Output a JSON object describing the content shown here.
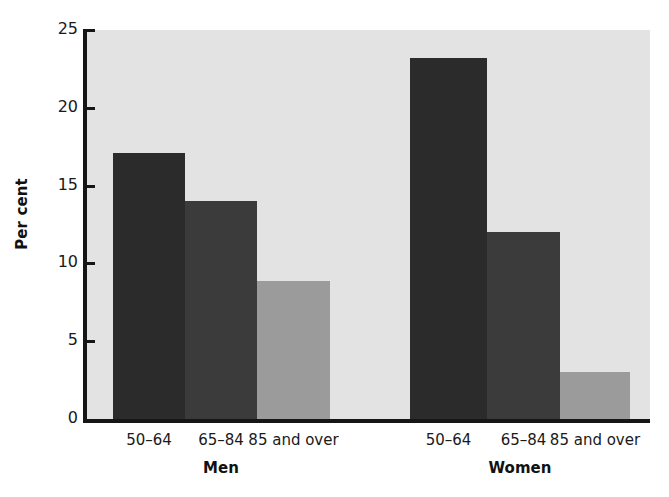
{
  "chart_data": {
    "type": "bar",
    "title": "",
    "subtitle": "",
    "xlabel": "",
    "ylabel": "Per cent",
    "ylim": [
      0,
      25
    ],
    "ytick_labels": [
      "0",
      "5",
      "10",
      "15",
      "20",
      "25"
    ],
    "ytick_values": [
      0,
      5,
      10,
      15,
      20,
      25
    ],
    "grid": false,
    "legend": "none",
    "categories": [
      "50–64",
      "65–84",
      "85 and over"
    ],
    "groups": [
      "Men",
      "Women"
    ],
    "series": [
      {
        "name": "Men",
        "values": [
          17.1,
          14.0,
          8.9
        ]
      },
      {
        "name": "Women",
        "values": [
          23.2,
          12.0,
          3.0
        ]
      }
    ],
    "bar_shades": [
      "dark",
      "medium",
      "light"
    ],
    "colors": {
      "bar_dark": "#2b2b2b",
      "bar_medium": "#3b3b3b",
      "bar_light": "#9b9b9b",
      "plot_background": "#e3e3e3",
      "axis": "#161616",
      "text": "#1a1a1a",
      "page_background": "#ffffff"
    }
  },
  "axis": {
    "y_title": "Per cent",
    "ticks": [
      {
        "label": "25",
        "value": 25
      },
      {
        "label": "20",
        "value": 20
      },
      {
        "label": "15",
        "value": 15
      },
      {
        "label": "10",
        "value": 10
      },
      {
        "label": "5",
        "value": 5
      },
      {
        "label": "0",
        "value": 0
      }
    ]
  },
  "bars": [
    {
      "group": "Men",
      "category": "50–64",
      "value": 17.1,
      "shade": "dark"
    },
    {
      "group": "Men",
      "category": "65–84",
      "value": 14.0,
      "shade": "medium"
    },
    {
      "group": "Men",
      "category": "85 and over",
      "value": 8.9,
      "shade": "light"
    },
    {
      "group": "Women",
      "category": "50–64",
      "value": 23.2,
      "shade": "dark"
    },
    {
      "group": "Women",
      "category": "65–84",
      "value": 12.0,
      "shade": "medium"
    },
    {
      "group": "Women",
      "category": "85 and over",
      "value": 3.0,
      "shade": "light"
    }
  ],
  "category_labels": [
    "50–64",
    "65–84",
    "85 and over",
    "50–64",
    "65–84",
    "85 and over"
  ],
  "group_labels": [
    "Men",
    "Women"
  ]
}
